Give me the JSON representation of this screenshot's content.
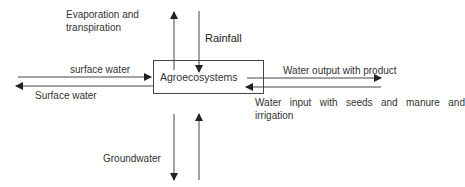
{
  "diagram": {
    "center": {
      "label": "Agroecosystems"
    },
    "flows": {
      "evaporation": {
        "line1": "Evaporation and",
        "line2": "transpiration",
        "direction": "out",
        "side": "top"
      },
      "rainfall": {
        "label": "Rainfall",
        "direction": "in",
        "side": "top"
      },
      "surface_in": {
        "label": "surface water",
        "direction": "in",
        "side": "left"
      },
      "surface_out": {
        "label": "Surface water",
        "direction": "out",
        "side": "left"
      },
      "product_out": {
        "label": "Water output with product",
        "direction": "out",
        "side": "right"
      },
      "input_in": {
        "label": "Water input with seeds and manure and irrigation",
        "direction": "in",
        "side": "right"
      },
      "groundwater": {
        "label": "Groundwater",
        "directions": [
          "out",
          "in"
        ],
        "side": "bottom"
      }
    },
    "colors": {
      "line": "#333333",
      "text": "#333333",
      "background": "#ffffff"
    }
  }
}
